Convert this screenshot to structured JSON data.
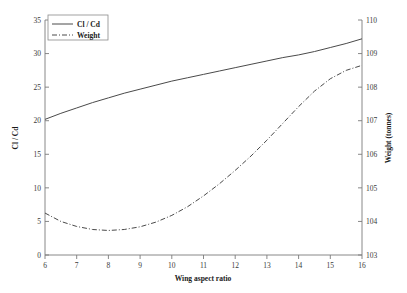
{
  "chart_data": {
    "type": "line",
    "title": "",
    "xlabel": "Wing aspect ratio",
    "ylabel": "Cl / Cd",
    "y2label": "Weight (tonnes)",
    "xlim": [
      6,
      16
    ],
    "ylim": [
      0,
      35
    ],
    "y2lim": [
      103,
      110
    ],
    "xticks": [
      "6",
      "7",
      "8",
      "9",
      "10",
      "11",
      "12",
      "13",
      "14",
      "15",
      "16"
    ],
    "yticks": [
      "0",
      "5",
      "10",
      "15",
      "20",
      "25",
      "30",
      "35"
    ],
    "y2ticks": [
      "103",
      "104",
      "105",
      "106",
      "107",
      "108",
      "109",
      "110"
    ],
    "grid": false,
    "legend_position": "top-left",
    "x": [
      6,
      6.5,
      7,
      7.5,
      8,
      8.5,
      9,
      9.5,
      10,
      10.5,
      11,
      11.5,
      12,
      12.5,
      13,
      13.5,
      14,
      14.5,
      15,
      15.5,
      16
    ],
    "series": [
      {
        "name": "Cl / Cd",
        "axis": "left",
        "style": "solid",
        "values": [
          20.2,
          21.1,
          21.9,
          22.7,
          23.4,
          24.1,
          24.7,
          25.3,
          25.9,
          26.4,
          26.9,
          27.4,
          27.9,
          28.4,
          28.9,
          29.4,
          29.8,
          30.3,
          30.9,
          31.5,
          32.2
        ]
      },
      {
        "name": "Weight",
        "axis": "right",
        "style": "dash-dot",
        "values": [
          104.25,
          104.0,
          103.85,
          103.76,
          103.73,
          103.76,
          103.84,
          103.98,
          104.18,
          104.44,
          104.76,
          105.12,
          105.52,
          105.95,
          106.42,
          106.92,
          107.42,
          107.88,
          108.25,
          108.5,
          108.65
        ]
      }
    ],
    "legend": [
      {
        "label": "Cl / Cd",
        "style": "solid"
      },
      {
        "label": "Weight",
        "style": "dash-dot"
      }
    ]
  },
  "colors": {
    "line": "#4a4a4a",
    "axis": "#7a7a7a",
    "text": "#1a1a1a",
    "background": "#ffffff"
  }
}
